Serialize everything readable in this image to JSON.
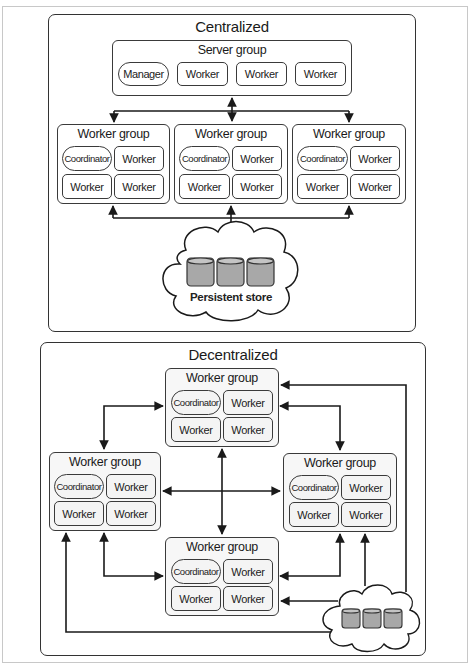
{
  "centralized": {
    "title": "Centralized",
    "server_group": {
      "title": "Server group",
      "nodes": [
        "Manager",
        "Worker",
        "Worker",
        "Worker"
      ]
    },
    "worker_groups": [
      {
        "title": "Worker group",
        "nodes": [
          "Coordinator",
          "Worker",
          "Worker",
          "Worker"
        ]
      },
      {
        "title": "Worker group",
        "nodes": [
          "Coordinator",
          "Worker",
          "Worker",
          "Worker"
        ]
      },
      {
        "title": "Worker group",
        "nodes": [
          "Coordinator",
          "Worker",
          "Worker",
          "Worker"
        ]
      }
    ],
    "store": {
      "label": "Persistent store",
      "cylinders": 3
    }
  },
  "decentralized": {
    "title": "Decentralized",
    "worker_groups": {
      "top": {
        "title": "Worker group",
        "nodes": [
          "Coordinator",
          "Worker",
          "Worker",
          "Worker"
        ]
      },
      "left": {
        "title": "Worker group",
        "nodes": [
          "Coordinator",
          "Worker",
          "Worker",
          "Worker"
        ]
      },
      "right": {
        "title": "Worker group",
        "nodes": [
          "Coordinator",
          "Worker",
          "Worker",
          "Worker"
        ]
      },
      "bottom": {
        "title": "Worker group",
        "nodes": [
          "Coordinator",
          "Worker",
          "Worker",
          "Worker"
        ]
      }
    },
    "store": {
      "cylinders": 3
    }
  },
  "colors": {
    "line": "#1a1a1a",
    "border": "#3a3a3a",
    "cylinder_fill": "#a8a8a8",
    "cylinder_top": "#c4c4c4",
    "shaded_group": "#f7f7f7"
  }
}
